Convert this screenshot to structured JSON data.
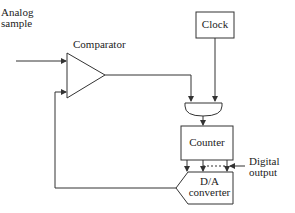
{
  "diagram": {
    "inputs": {
      "analog_line1": "Analog",
      "analog_line2": "sample"
    },
    "blocks": {
      "comparator": "Comparator",
      "clock": "Clock",
      "counter": "Counter",
      "dac_line1": "D/A",
      "dac_line2": "converter",
      "gate": "AND gate"
    },
    "outputs": {
      "digital_line1": "Digital",
      "digital_line2": "output"
    },
    "colors": {
      "line": "#333333",
      "background": "#ffffff"
    }
  }
}
